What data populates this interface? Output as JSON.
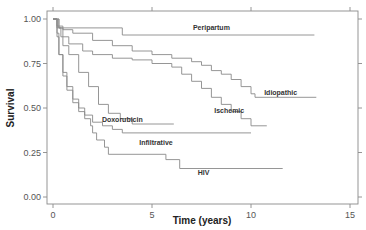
{
  "chart_data": {
    "type": "line",
    "subtype": "kaplan-meier step",
    "title": "",
    "xlabel": "Time (years)",
    "ylabel": "Survival",
    "xlim": [
      0,
      15
    ],
    "ylim": [
      0,
      1
    ],
    "xticks": [
      0,
      5,
      10,
      15
    ],
    "xtick_labels": [
      "0",
      "5",
      "10",
      "15"
    ],
    "yticks": [
      0,
      0.25,
      0.5,
      0.75,
      1.0
    ],
    "ytick_labels": [
      "0.00",
      "0.25",
      "0.50",
      "0.75",
      "1.00"
    ],
    "grid": false,
    "legend": "inline labels",
    "series": [
      {
        "name": "Peripartum",
        "label_pos": [
          8.0,
          0.955
        ],
        "points": [
          [
            0,
            1.0
          ],
          [
            0.3,
            1.0
          ],
          [
            0.3,
            0.95
          ],
          [
            3.5,
            0.95
          ],
          [
            3.5,
            0.91
          ],
          [
            13.2,
            0.91
          ]
        ]
      },
      {
        "name": "Idiopathic",
        "label_pos": [
          11.5,
          0.585
        ],
        "points": [
          [
            0,
            1.0
          ],
          [
            0.2,
            0.96
          ],
          [
            0.5,
            0.94
          ],
          [
            1.0,
            0.92
          ],
          [
            2.0,
            0.88
          ],
          [
            3.0,
            0.85
          ],
          [
            4.0,
            0.82
          ],
          [
            5.0,
            0.8
          ],
          [
            6.0,
            0.78
          ],
          [
            7.0,
            0.76
          ],
          [
            7.5,
            0.74
          ],
          [
            8.0,
            0.71
          ],
          [
            8.5,
            0.69
          ],
          [
            9.0,
            0.66
          ],
          [
            9.5,
            0.62
          ],
          [
            10.0,
            0.58
          ],
          [
            10.2,
            0.56
          ],
          [
            13.3,
            0.56
          ]
        ]
      },
      {
        "name": "Ischemic",
        "label_pos": [
          8.9,
          0.485
        ],
        "points": [
          [
            0,
            1.0
          ],
          [
            0.2,
            0.95
          ],
          [
            0.4,
            0.9
          ],
          [
            0.8,
            0.86
          ],
          [
            1.5,
            0.82
          ],
          [
            2.0,
            0.8
          ],
          [
            3.0,
            0.78
          ],
          [
            4.0,
            0.77
          ],
          [
            5.0,
            0.75
          ],
          [
            6.0,
            0.73
          ],
          [
            6.5,
            0.69
          ],
          [
            7.0,
            0.65
          ],
          [
            7.5,
            0.61
          ],
          [
            8.0,
            0.56
          ],
          [
            8.5,
            0.52
          ],
          [
            9.0,
            0.48
          ],
          [
            9.5,
            0.44
          ],
          [
            10.0,
            0.4
          ],
          [
            10.8,
            0.4
          ]
        ]
      },
      {
        "name": "Doxorubicin",
        "label_pos": [
          3.5,
          0.435
        ],
        "points": [
          [
            0,
            1.0
          ],
          [
            0.3,
            0.95
          ],
          [
            0.5,
            0.85
          ],
          [
            0.8,
            0.8
          ],
          [
            1.3,
            0.8
          ],
          [
            1.3,
            0.7
          ],
          [
            1.8,
            0.7
          ],
          [
            1.8,
            0.62
          ],
          [
            2.3,
            0.62
          ],
          [
            2.3,
            0.52
          ],
          [
            2.8,
            0.52
          ],
          [
            2.8,
            0.47
          ],
          [
            3.4,
            0.47
          ],
          [
            3.4,
            0.44
          ],
          [
            4.0,
            0.44
          ],
          [
            4.0,
            0.41
          ],
          [
            6.1,
            0.41
          ]
        ]
      },
      {
        "name": "Infiltrative",
        "label_pos": [
          5.2,
          0.305
        ],
        "points": [
          [
            0,
            1.0
          ],
          [
            0.2,
            0.92
          ],
          [
            0.3,
            0.8
          ],
          [
            0.5,
            0.7
          ],
          [
            0.7,
            0.62
          ],
          [
            1.0,
            0.55
          ],
          [
            1.3,
            0.5
          ],
          [
            1.6,
            0.46
          ],
          [
            2.0,
            0.42
          ],
          [
            2.5,
            0.4
          ],
          [
            3.0,
            0.38
          ],
          [
            3.5,
            0.36
          ],
          [
            10.0,
            0.36
          ]
        ]
      },
      {
        "name": "HIV",
        "label_pos": [
          7.6,
          0.135
        ],
        "points": [
          [
            0,
            1.0
          ],
          [
            0.2,
            0.9
          ],
          [
            0.3,
            0.8
          ],
          [
            0.5,
            0.68
          ],
          [
            0.7,
            0.6
          ],
          [
            1.0,
            0.53
          ],
          [
            1.3,
            0.48
          ],
          [
            1.6,
            0.44
          ],
          [
            1.9,
            0.4
          ],
          [
            2.0,
            0.36
          ],
          [
            2.2,
            0.32
          ],
          [
            2.6,
            0.28
          ],
          [
            2.8,
            0.24
          ],
          [
            5.7,
            0.24
          ],
          [
            5.7,
            0.21
          ],
          [
            6.4,
            0.21
          ],
          [
            6.4,
            0.16
          ],
          [
            11.6,
            0.16
          ]
        ]
      }
    ]
  },
  "plot": {
    "ylabel": "Survival",
    "xlabel": "Time (years)",
    "colors": {
      "curve": "#8a8a8a",
      "frame": "#8a8a8a",
      "text": "#333333"
    }
  }
}
